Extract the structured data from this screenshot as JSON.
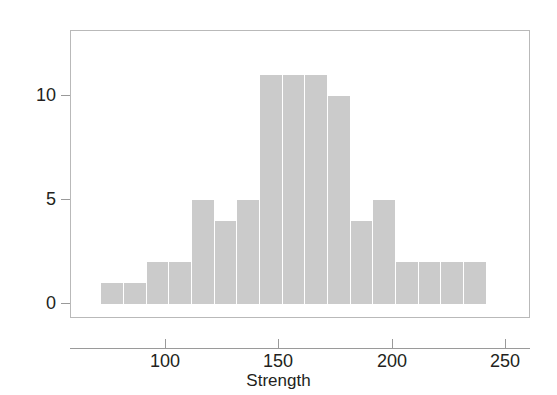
{
  "chart_data": {
    "type": "bar",
    "title": "",
    "subtitle": "",
    "xlabel": "Strength",
    "ylabel": "Frequency",
    "xlim": [
      71.5,
      241.5
    ],
    "ylim": [
      0,
      11.6
    ],
    "grid": false,
    "legend": null,
    "bin_width": 10,
    "bin_edges": [
      71.5,
      81.5,
      91.5,
      101.5,
      111.5,
      121.5,
      131.5,
      141.5,
      151.5,
      161.5,
      171.5,
      181.5,
      191.5,
      201.5,
      211.5,
      221.5,
      231.5,
      241.5
    ],
    "bin_centers": [
      76.5,
      86.5,
      96.5,
      106.5,
      116.5,
      126.5,
      136.5,
      146.5,
      156.5,
      166.5,
      176.5,
      186.5,
      196.5,
      206.5,
      216.5,
      226.5,
      236.5
    ],
    "values": [
      1,
      1,
      2,
      2,
      5,
      4,
      5,
      11,
      11,
      11,
      10,
      4,
      5,
      2,
      2,
      2,
      2
    ],
    "categories": [
      "71.5-81.5",
      "81.5-91.5",
      "91.5-101.5",
      "101.5-111.5",
      "111.5-121.5",
      "121.5-131.5",
      "131.5-141.5",
      "141.5-151.5",
      "151.5-161.5",
      "161.5-171.5",
      "171.5-181.5",
      "181.5-191.5",
      "191.5-201.5",
      "201.5-211.5",
      "211.5-221.5",
      "221.5-231.5",
      "231.5-241.5"
    ],
    "xticks": [
      100,
      150,
      200,
      250
    ],
    "xtick_labels": [
      "100",
      "150",
      "200",
      "250"
    ],
    "yticks": [
      0,
      5,
      10
    ],
    "ytick_labels": [
      "0",
      "5",
      "10"
    ],
    "bar_color": "#cbcbcb",
    "axis_color": "#9a9a9a",
    "text_color": "#231f20",
    "background_color": "#ffffff"
  }
}
